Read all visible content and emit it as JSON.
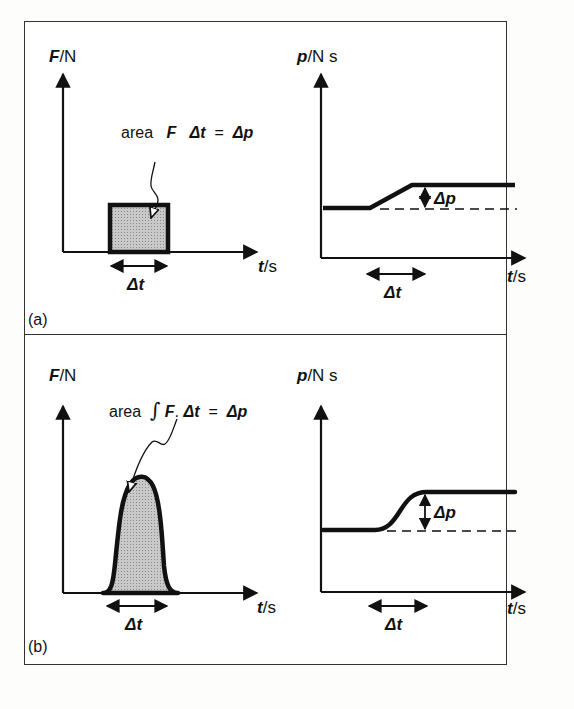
{
  "figure": {
    "panels": [
      {
        "tag": "(a)",
        "left_graph": {
          "y_axis_label_symbol": "F",
          "y_axis_label_unit": "/N",
          "x_axis_label_symbol": "t",
          "x_axis_label_unit": "/s",
          "annotation_prefix": "area",
          "annotation_F": "F",
          "annotation_dt": "Δt",
          "annotation_eq": "=",
          "annotation_dp": "Δp",
          "interval_label": "Δt",
          "pulse_shape": "rectangle"
        },
        "right_graph": {
          "y_axis_label_symbol": "p",
          "y_axis_label_unit": "/N s",
          "x_axis_label_symbol": "t",
          "x_axis_label_unit": "/s",
          "change_label": "Δp",
          "interval_label": "Δt",
          "curve_shape": "linear ramp"
        }
      },
      {
        "tag": "(b)",
        "left_graph": {
          "y_axis_label_symbol": "F",
          "y_axis_label_unit": "/N",
          "x_axis_label_symbol": "t",
          "x_axis_label_unit": "/s",
          "annotation_prefix": "area",
          "annotation_integral": "∫",
          "annotation_F": "F",
          "annotation_dot": ".",
          "annotation_dt": "Δt",
          "annotation_eq": "=",
          "annotation_dp": "Δp",
          "interval_label": "Δt",
          "pulse_shape": "bell curve"
        },
        "right_graph": {
          "y_axis_label_symbol": "p",
          "y_axis_label_unit": "/N s",
          "x_axis_label_symbol": "t",
          "x_axis_label_unit": "/s",
          "change_label": "Δp",
          "interval_label": "Δt",
          "curve_shape": "smooth S-curve"
        }
      }
    ],
    "colors": {
      "ink": "#111111",
      "fill": "#bdbdbd",
      "border": "#333333"
    }
  }
}
